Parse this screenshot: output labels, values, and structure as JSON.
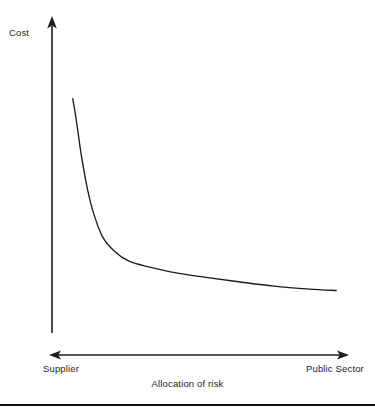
{
  "figure": {
    "name": "cost-vs-allocation-of-risk-diagram",
    "background_color": "#ffffff",
    "ink_color": "#1c1c1c",
    "rule_color": "#111111"
  },
  "chart_data": {
    "type": "line",
    "title": "",
    "subtitle": "",
    "xlabel": "Allocation of risk",
    "ylabel": "Cost",
    "grid": false,
    "legend": null,
    "legend_position": "none",
    "axis_style": "arrow-headed, no numeric ticks",
    "xlim": [
      0,
      1
    ],
    "ylim": [
      0,
      1
    ],
    "xtick_labels": [
      "Supplier",
      "Public Sector"
    ],
    "ytick_labels": [],
    "annotations": [],
    "series": [
      {
        "name": "cost curve",
        "style": "smooth convex decreasing (hyperbolic) curve",
        "x": [
          0.07,
          0.08,
          0.09,
          0.1,
          0.12,
          0.14,
          0.17,
          0.21,
          0.26,
          0.33,
          0.42,
          0.52,
          0.63,
          0.75,
          0.87,
          0.96
        ],
        "y": [
          0.8,
          0.74,
          0.67,
          0.6,
          0.49,
          0.41,
          0.33,
          0.28,
          0.245,
          0.225,
          0.205,
          0.19,
          0.175,
          0.16,
          0.15,
          0.145
        ]
      }
    ]
  },
  "axes": {
    "y_axis": {
      "label": "Cost",
      "arrow": "up"
    },
    "x_axis": {
      "label": "Allocation of risk",
      "left_label": "Supplier",
      "right_label": "Public Sector",
      "arrow": "double"
    }
  }
}
